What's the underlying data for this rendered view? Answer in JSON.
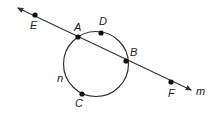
{
  "diagram": {
    "type": "geometry",
    "circle": {
      "center": [
        96,
        64
      ],
      "radius": 32.5,
      "label": "n",
      "label_pos": [
        57,
        82
      ]
    },
    "line": {
      "label": "m",
      "start": [
        18,
        8
      ],
      "end": [
        191,
        90
      ],
      "label_pos": [
        196,
        95
      ]
    },
    "points": [
      {
        "name": "E",
        "pos": [
          35,
          15
        ],
        "label_pos": [
          30,
          29
        ]
      },
      {
        "name": "A",
        "pos": [
          78,
          37
        ],
        "label_pos": [
          74,
          31
        ]
      },
      {
        "name": "D",
        "pos": [
          101,
          33
        ],
        "label_pos": [
          99,
          25
        ]
      },
      {
        "name": "B",
        "pos": [
          126,
          61
        ],
        "label_pos": [
          130,
          56
        ]
      },
      {
        "name": "F",
        "pos": [
          171,
          82
        ],
        "label_pos": [
          168,
          97
        ]
      },
      {
        "name": "C",
        "pos": [
          82,
          94
        ],
        "label_pos": [
          75,
          107
        ]
      }
    ],
    "colors": {
      "stroke": "#333333",
      "point": "#111111",
      "label": "#222222"
    }
  }
}
